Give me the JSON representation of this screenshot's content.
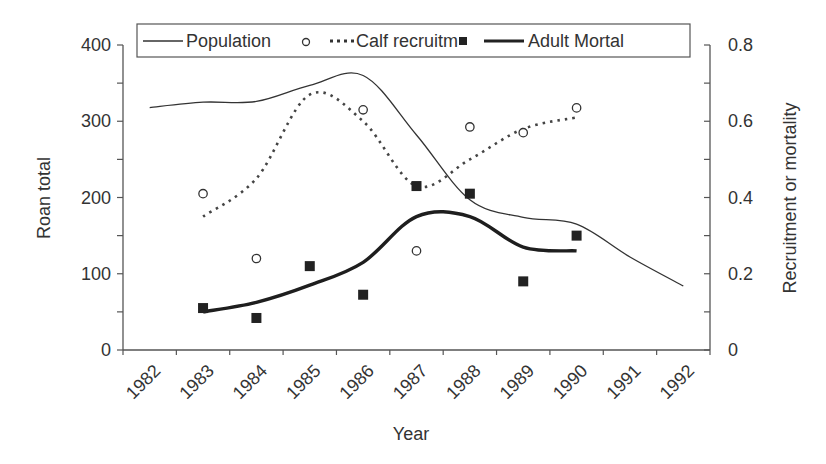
{
  "chart_data": {
    "type": "line",
    "title": "",
    "xlabel": "Year",
    "ylabel": "Roan total",
    "y2label": "Recruitment or mortality",
    "categories": [
      "1982",
      "1983",
      "1984",
      "1985",
      "1986",
      "1987",
      "1988",
      "1989",
      "1990",
      "1991",
      "1992"
    ],
    "ylim": [
      0,
      400
    ],
    "y2lim": [
      0,
      0.8
    ],
    "yticks": [
      "0",
      "100",
      "200",
      "300",
      "400"
    ],
    "y2ticks": [
      "0",
      "0.2",
      "0.4",
      "0.6",
      "0.8"
    ],
    "grid": false,
    "legend_position": "top",
    "legend": [
      {
        "label": "Population",
        "style": "thin-solid-line",
        "marker": "circle-open"
      },
      {
        "label": "Calf recruitm",
        "style": "dotted-line",
        "marker": "square-filled"
      },
      {
        "label": "Adult Mortal",
        "style": "thick-solid-line"
      }
    ],
    "series": [
      {
        "name": "Population",
        "axis": "left",
        "kind": "smoothed-line",
        "x": [
          "1982",
          "1983",
          "1984",
          "1985",
          "1986",
          "1987",
          "1988",
          "1989",
          "1990",
          "1991",
          "1992"
        ],
        "values": [
          318,
          325,
          326,
          347,
          360,
          282,
          197,
          174,
          165,
          122,
          84
        ]
      },
      {
        "name": "Calf recruitment (smoothed)",
        "axis": "right",
        "kind": "dotted-line",
        "x": [
          "1983",
          "1984",
          "1985",
          "1986",
          "1987",
          "1988",
          "1989",
          "1990"
        ],
        "values": [
          0.35,
          0.45,
          0.67,
          0.6,
          0.43,
          0.5,
          0.58,
          0.61
        ]
      },
      {
        "name": "Adult mortality (smoothed)",
        "axis": "right",
        "kind": "thick-line",
        "x": [
          "1983",
          "1984",
          "1985",
          "1986",
          "1987",
          "1988",
          "1989",
          "1990"
        ],
        "values": [
          0.1,
          0.125,
          0.17,
          0.23,
          0.35,
          0.35,
          0.27,
          0.26
        ]
      },
      {
        "name": "Calf recruitment (observed)",
        "axis": "right",
        "kind": "circle-markers",
        "x": [
          "1983",
          "1984",
          "1986",
          "1987",
          "1988",
          "1989",
          "1990"
        ],
        "values": [
          0.41,
          0.24,
          0.63,
          0.26,
          0.585,
          0.57,
          0.635
        ]
      },
      {
        "name": "Adult mortality (observed)",
        "axis": "right",
        "kind": "square-markers",
        "x": [
          "1983",
          "1984",
          "1985",
          "1986",
          "1987",
          "1988",
          "1989",
          "1990"
        ],
        "values": [
          0.11,
          0.084,
          0.22,
          0.145,
          0.43,
          0.41,
          0.18,
          0.3
        ]
      }
    ]
  },
  "colors": {
    "ink": "#333333",
    "axis": "#555555",
    "background": "#ffffff"
  }
}
